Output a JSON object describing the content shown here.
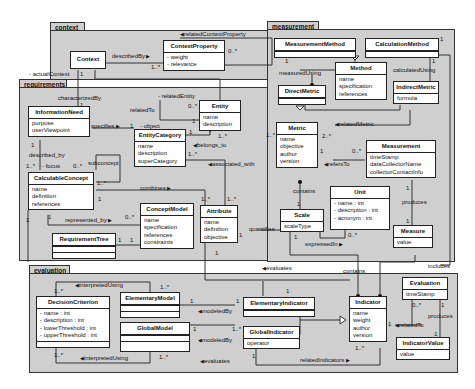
{
  "packages": {
    "context": "context",
    "requirements": "requirements",
    "measurement": "measurement",
    "evaluation": "evaluation"
  },
  "classes": {
    "Context": {
      "name": "Context",
      "attrs": []
    },
    "ContextProperty": {
      "name": "ContextProperty",
      "attrs": [
        "- weight",
        "- relevance"
      ]
    },
    "InformationNeed": {
      "name": "InformationNeed",
      "attrs": [
        "purpose",
        "userViewpoint"
      ]
    },
    "Entity": {
      "name": "Entity",
      "attrs": [
        "name",
        "description"
      ]
    },
    "EntityCategory": {
      "name": "EntityCategory",
      "attrs": [
        "name",
        "description",
        "superCategory"
      ]
    },
    "CalculableConcept": {
      "name": "CalculableConcept",
      "attrs": [
        "name",
        "definition",
        "references"
      ]
    },
    "ConceptModel": {
      "name": "ConceptModel",
      "attrs": [
        "name",
        "specification",
        "references",
        "constraints"
      ]
    },
    "Attribute": {
      "name": "Attribute",
      "attrs": [
        "name",
        "definition",
        "objective"
      ]
    },
    "RequirementTree": {
      "name": "RequirementTree",
      "attrs": []
    },
    "MeasurementMethod": {
      "name": "MeasurementMethod",
      "attrs": []
    },
    "CalculationMethod": {
      "name": "CalculationMethod",
      "attrs": []
    },
    "Method": {
      "name": "Method",
      "attrs": [
        "name",
        "specification",
        "references"
      ]
    },
    "DirectMetric": {
      "name": "DirectMetric",
      "attrs": []
    },
    "IndirectMetric": {
      "name": "IndirectMetric",
      "attrs": [
        "formula"
      ]
    },
    "Metric": {
      "name": "Metric",
      "attrs": [
        "name",
        "objective",
        "author",
        "version"
      ]
    },
    "Measurement": {
      "name": "Measurement",
      "attrs": [
        "timeStamp",
        "dataCollectorName",
        "collectorContactInfo"
      ]
    },
    "Unit": {
      "name": "Unit",
      "attrs": [
        "- name : int",
        "- description : int",
        "- acronym : int"
      ]
    },
    "Scale": {
      "name": "Scale",
      "attrs": [
        "scaleType"
      ]
    },
    "Measure": {
      "name": "Measure",
      "attrs": [
        "value"
      ]
    },
    "DecisionCriterion": {
      "name": "DecisionCriterion",
      "attrs": [
        "- name : int",
        "- description : int",
        "- lowerThreshold : int",
        "- upperThreshold : int"
      ]
    },
    "ElementaryModel": {
      "name": "ElementaryModel",
      "attrs": []
    },
    "GlobalModel": {
      "name": "GlobalModel",
      "attrs": []
    },
    "ElementaryIndicator": {
      "name": "ElementaryIndicator",
      "attrs": []
    },
    "GlobalIndicator": {
      "name": "GlobalIndicator",
      "attrs": [
        "operator"
      ]
    },
    "Indicator": {
      "name": "Indicator",
      "attrs": [
        "name",
        "weight",
        "author",
        "version"
      ]
    },
    "Evaluation": {
      "name": "Evaluation",
      "attrs": [
        "timeStamp"
      ]
    },
    "IndicatorValue": {
      "name": "IndicatorValue",
      "attrs": [
        "value"
      ]
    }
  },
  "labels": {
    "relatedContextProperty": "relatedContextProperty",
    "describedBy_ctx": "describedBy",
    "actualContext": "- actualContext",
    "characterizedBy": "characterizedBy",
    "relatedEntity": "- relatedEntity",
    "relatedTo": "relatedTo",
    "specifies": "specifies",
    "object": "- object",
    "belongs_to": "belongs_to",
    "associated_with": "associated_with",
    "described_by": "described_by",
    "focus": "- focus",
    "subconcept": "subconcept",
    "combines": "combines",
    "represented_by": "represented_by",
    "quantifies": "quantifies",
    "evaluates_top": "evaluates",
    "measuredUsing": "measuredUsing",
    "calculatedUsing": "calculatedUsing",
    "relatedMetric": "relatedMetric",
    "refersTo": "refersTo",
    "contains_m": "contains",
    "produces_m": "produces",
    "expressedIn": "expressedIn",
    "contains_e": "contains",
    "includes": "includes",
    "interpretedUsing_top": "interpretedUsing",
    "interpretedUsing_bot": "interpretedUsing",
    "modeledBy_1": "modeledBy",
    "modeledBy_2": "modeledBy",
    "evaluates_bot": "evaluates",
    "relatedIndicators": "relatedIndicators",
    "relatedTo_e": "relatedTo",
    "produces_e": "produces"
  },
  "multiplicities": {
    "m_ctxprop_0n": "0..*",
    "m_ctxprop_1n": "1..*",
    "m_actual_1": "1",
    "m_ent_0n": "0..*",
    "m_ent_1": "1",
    "m_ent_1n": "1..*",
    "m_ec_1": "1",
    "m_ec_1n": "1..*",
    "m_in_1": "1",
    "m_in_1b": "1",
    "m_spec_1": "1",
    "m_cc_1n": "1..*",
    "m_cc_0n": "0..*",
    "m_cc_1nb": "1..*",
    "m_cc_1": "1",
    "m_cc_1c": "1",
    "m_cm_0n": "0..*",
    "m_attr_1n": "1..*",
    "m_attr_1nb": "1..*",
    "m_attr_1": "1",
    "m_attr_1b": "1",
    "m_rt_1": "1",
    "m_rt_1b": "1",
    "m_in_left1": "1",
    "m_mm_1": "1",
    "m_calc_1": "1",
    "m_calc_1b": "1",
    "m_metric_2n": "2..*",
    "m_metric_1": "1",
    "m_metric_1n": "1..*",
    "m_meas_0n": "0..*",
    "m_meas_1": "1",
    "m_measure_1": "1",
    "m_scale_1": "1",
    "m_scale_1b": "1",
    "m_unit_0n": "0..*",
    "m_dc_1n": "1..*",
    "m_dc_1nb": "1..*",
    "m_em_1n": "1..*",
    "m_em_1": "1",
    "m_ei_1": "1",
    "m_ei_1b": "1",
    "m_gm_1": "1",
    "m_gm_1n": "1..*",
    "m_gm_1nb": "1..*",
    "m_gi_1": "1",
    "m_ind_1n": "1..*",
    "m_ind_1": "1",
    "m_ev_0n": "0..*",
    "m_ev_1": "1",
    "m_iv_1": "1"
  },
  "colors": {
    "package_fill": "#cfcfcf",
    "class_fill": "#ffffff",
    "line": "#333333"
  }
}
